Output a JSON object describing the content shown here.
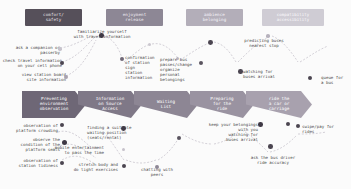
{
  "canvas": {
    "width": 351,
    "height": 189,
    "background": "#fbfbfb"
  },
  "legend": {
    "title": "emotional / experiential dimensions",
    "items": [
      {
        "label_line1": "comfort/",
        "label_line2": "safety",
        "color": "#56505a",
        "text_color": "#e8e4ea"
      },
      {
        "label_line1": "enjoyment",
        "label_line2": "release",
        "color": "#8d8795",
        "text_color": "#f0edf2"
      },
      {
        "label_line1": "ambience",
        "label_line2": "belonging",
        "color": "#b3aeb9",
        "text_color": "#f6f4f8"
      },
      {
        "label_line1": "compatibility",
        "label_line2": "accessibility",
        "color": "#cfccd4",
        "text_color": "#fbfafc"
      }
    ]
  },
  "stages": [
    {
      "id": "stage-1",
      "line1": "Preventing",
      "line2": "environment",
      "line3": "observation",
      "color": "#6e6776"
    },
    {
      "id": "stage-2",
      "line1": "Information",
      "line2": "on Source",
      "line3": "Access",
      "color": "#7f7887"
    },
    {
      "id": "stage-3",
      "line1": "Waiting",
      "line2": "List",
      "line3": "",
      "color": "#8d8694"
    },
    {
      "id": "stage-4",
      "line1": "Preparing",
      "line2": "for the",
      "line3": "ride",
      "color": "#9a93a1"
    },
    {
      "id": "stage-5",
      "line1": "ride the",
      "line2": "a car or",
      "line3": "carriage",
      "color": "#a8a1ae"
    }
  ],
  "notes_above": [
    {
      "id": "note-companion",
      "align": "right",
      "lines": [
        "ask a companion or",
        "passerby"
      ]
    },
    {
      "id": "note-check-phone",
      "align": "right",
      "lines": [
        "check travel information",
        "on your cell phone"
      ]
    },
    {
      "id": "note-station-board",
      "align": "right",
      "lines": [
        "view station board",
        "site information"
      ]
    },
    {
      "id": "note-familiarize",
      "align": "center",
      "lines": [
        "familiarize yourself",
        "with travel information"
      ]
    },
    {
      "id": "note-confirmation",
      "align": "left",
      "lines": [
        "confirmation",
        "of station",
        "sign",
        "station",
        "information"
      ]
    },
    {
      "id": "note-prepare-pass",
      "align": "left",
      "lines": [
        "prepare bus",
        "passes/change",
        "organize",
        "personal",
        "belongings"
      ]
    },
    {
      "id": "note-predicting",
      "align": "center",
      "lines": [
        "predicting buses",
        "nearest stop"
      ]
    },
    {
      "id": "note-watching-arrival",
      "align": "left",
      "lines": [
        "watching for",
        "buses arrival"
      ]
    },
    {
      "id": "note-queue",
      "align": "left",
      "lines": [
        "queue for",
        "a bus"
      ]
    }
  ],
  "notes_below": [
    {
      "id": "note-platform-crowding",
      "align": "right",
      "lines": [
        "observation of",
        "platform crowding"
      ]
    },
    {
      "id": "note-platform-seats",
      "align": "right",
      "lines": [
        "observe the",
        "condition of the",
        "platform seats"
      ]
    },
    {
      "id": "note-station-tidiness",
      "align": "right",
      "lines": [
        "observation of",
        "station tidiness"
      ]
    },
    {
      "id": "note-waiting-position",
      "align": "left",
      "lines": [
        "finding a suitable",
        "waiting position",
        "(seats/rental)"
      ]
    },
    {
      "id": "note-mobile-entertainment",
      "align": "right",
      "lines": [
        "mobile entertainment",
        "to pass the time"
      ]
    },
    {
      "id": "note-stretch",
      "align": "right",
      "lines": [
        "stretch body and",
        "do light exercises"
      ]
    },
    {
      "id": "note-chatting",
      "align": "center",
      "lines": [
        "chatting with",
        "peers"
      ]
    },
    {
      "id": "note-keep-belongings",
      "align": "right",
      "lines": [
        "keep your belongings",
        "with you",
        "watching for",
        "buses arrival"
      ]
    },
    {
      "id": "note-swipe-pay",
      "align": "left",
      "lines": [
        "swipe/pay for",
        "rides"
      ]
    },
    {
      "id": "note-ask-driver",
      "align": "center",
      "lines": [
        "ask the bus driver",
        "ride accuracy"
      ]
    }
  ],
  "dot_palette": {
    "dark": "#4b4550",
    "mid": "#6f6877",
    "light": "#a8a2ae",
    "pale": "#c6c2cb"
  }
}
